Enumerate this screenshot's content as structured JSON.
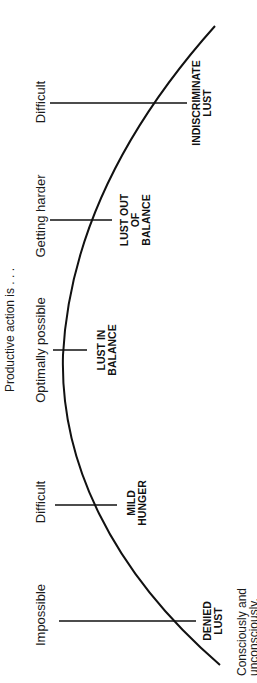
{
  "diagram": {
    "title": "Productive action is . . .",
    "orientation": "rotated-90-ccw",
    "colors": {
      "ink": "#111111",
      "background": "#ffffff"
    },
    "stages": [
      {
        "action_level": "Difficult",
        "state_lines": [
          "INDISCRIMINATE",
          "LUST"
        ]
      },
      {
        "action_level": "Getting harder",
        "state_lines": [
          "LUST OUT",
          "OF",
          "BALANCE"
        ]
      },
      {
        "action_level": "Optimally possible",
        "state_lines": [
          "LUST IN",
          "BALANCE"
        ]
      },
      {
        "action_level": "Difficult",
        "state_lines": [
          "MILD",
          "HUNGER"
        ]
      },
      {
        "action_level": "Impossible",
        "state_lines": [
          "DENIED",
          "LUST"
        ]
      }
    ],
    "footnote_lines": [
      "Consciously and",
      "unconsciously,"
    ]
  }
}
